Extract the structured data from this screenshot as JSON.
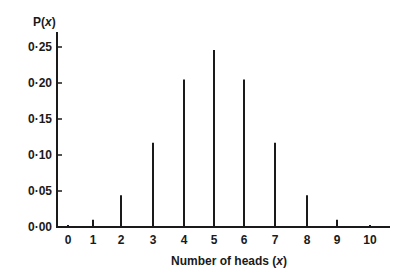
{
  "chart_data": {
    "type": "bar",
    "title": "",
    "xlabel": "Number of heads (x)",
    "ylabel": "P(x)",
    "categories": [
      "0",
      "1",
      "2",
      "3",
      "4",
      "5",
      "6",
      "7",
      "8",
      "9",
      "10"
    ],
    "values": [
      0.001,
      0.01,
      0.044,
      0.117,
      0.205,
      0.246,
      0.205,
      0.117,
      0.044,
      0.01,
      0.001
    ],
    "ylim": [
      0,
      0.27
    ],
    "yticks": [
      "0·00",
      "0·05",
      "0·10",
      "0·15",
      "0·20",
      "0·25"
    ],
    "ytick_values": [
      0,
      0.05,
      0.1,
      0.15,
      0.2,
      0.25
    ],
    "grid": false,
    "legend": null,
    "style": "vertical line (stick) plot"
  },
  "labels": {
    "y_axis_title": "P(x)",
    "x_axis_title": "Number of heads (x)"
  },
  "colors": {
    "ink": "#1a1a1a",
    "background": "#ffffff"
  }
}
